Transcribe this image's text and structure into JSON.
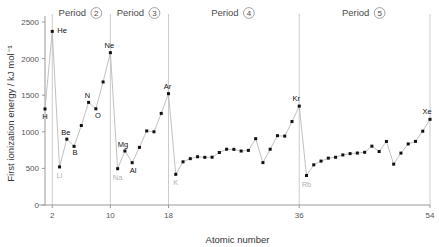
{
  "chart_data": {
    "type": "line",
    "title": "",
    "xlabel": "Atomic number",
    "ylabel": "First ionization energy / kJ mol⁻¹",
    "xlim": [
      1,
      54
    ],
    "ylim": [
      0,
      2500
    ],
    "xticks": [
      2,
      10,
      18,
      36,
      54
    ],
    "yticks": [
      0,
      500,
      1000,
      1500,
      2000,
      2500
    ],
    "grid": false,
    "legend": "none",
    "x": [
      1,
      2,
      3,
      4,
      5,
      6,
      7,
      8,
      9,
      10,
      11,
      12,
      13,
      14,
      15,
      16,
      17,
      18,
      19,
      20,
      21,
      22,
      23,
      24,
      25,
      26,
      27,
      28,
      29,
      30,
      31,
      32,
      33,
      34,
      35,
      36,
      37,
      38,
      39,
      40,
      41,
      42,
      43,
      44,
      45,
      46,
      47,
      48,
      49,
      50,
      51,
      52,
      53,
      54
    ],
    "values": [
      1312,
      2372,
      520,
      900,
      801,
      1086,
      1402,
      1314,
      1681,
      2081,
      496,
      738,
      578,
      787,
      1012,
      1000,
      1251,
      1521,
      419,
      590,
      633,
      659,
      651,
      653,
      717,
      762,
      760,
      737,
      746,
      906,
      579,
      762,
      947,
      941,
      1140,
      1351,
      403,
      549,
      600,
      640,
      652,
      684,
      702,
      710,
      720,
      804,
      731,
      868,
      558,
      709,
      834,
      869,
      1008,
      1170
    ],
    "point_labels": [
      {
        "x": 1,
        "label": "H",
        "style": "dark"
      },
      {
        "x": 2,
        "label": "He",
        "style": "dark"
      },
      {
        "x": 3,
        "label": "Li",
        "style": "faint"
      },
      {
        "x": 4,
        "label": "Be",
        "style": "dark"
      },
      {
        "x": 5,
        "label": "B",
        "style": "dark"
      },
      {
        "x": 7,
        "label": "N",
        "style": "dark"
      },
      {
        "x": 8,
        "label": "O",
        "style": "dark"
      },
      {
        "x": 10,
        "label": "Ne",
        "style": "dark"
      },
      {
        "x": 11,
        "label": "Na",
        "style": "faint"
      },
      {
        "x": 12,
        "label": "Mg",
        "style": "dark"
      },
      {
        "x": 13,
        "label": "Al",
        "style": "dark"
      },
      {
        "x": 18,
        "label": "Ar",
        "style": "dark"
      },
      {
        "x": 19,
        "label": "K",
        "style": "faint"
      },
      {
        "x": 36,
        "label": "Kr",
        "style": "dark"
      },
      {
        "x": 37,
        "label": "Rb",
        "style": "faint"
      },
      {
        "x": 54,
        "label": "Xe",
        "style": "dark"
      }
    ],
    "period_dividers": [
      2,
      10,
      18,
      36,
      54
    ],
    "period_annotations": [
      {
        "text": "Period",
        "number": "2"
      },
      {
        "text": "Period",
        "number": "3"
      },
      {
        "text": "Period",
        "number": "4"
      },
      {
        "text": "Period",
        "number": "5"
      }
    ],
    "colors": {
      "point": "#111111",
      "line": "#b9b9b9",
      "axis": "#999999",
      "divider": "#cccccc",
      "label_faint": "#b0b0b0"
    }
  }
}
